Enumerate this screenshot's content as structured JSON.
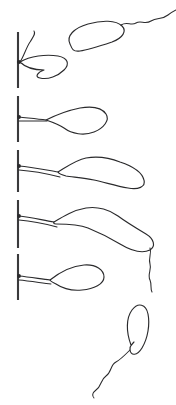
{
  "figure": {
    "title": "Bacterial attachment sequence",
    "width": 176,
    "height": 405,
    "background_color": "#ffffff",
    "ink_color": "#2a2a2c",
    "substratum_color": "#3a3a3c",
    "style": "line drawing, ink on white, no labels or text"
  },
  "substratum": {
    "name": "surface-line",
    "orientation": "vertical",
    "style": "dashed",
    "x": 18,
    "segments": [
      {
        "id": "seg-1",
        "y_top": 32,
        "y_bottom": 88
      },
      {
        "id": "seg-2",
        "y_top": 96,
        "y_bottom": 142
      },
      {
        "id": "seg-3",
        "y_top": 150,
        "y_bottom": 192
      },
      {
        "id": "seg-4",
        "y_top": 200,
        "y_bottom": 248
      },
      {
        "id": "seg-5",
        "y_top": 254,
        "y_bottom": 300
      }
    ]
  },
  "cells": [
    {
      "id": "cell-free-top",
      "label": "free-swimming cell, upper right",
      "state": "unattached",
      "shape": "curved rod (vibrio)",
      "flagellum": "single polar, wavy, trailing to upper right",
      "body_path": "M 70 44 C 66 36, 74 28, 88 24 C 102 20, 116 20, 122 26 C 127 31, 123 38, 112 42 C 100 46, 88 50, 80 51 C 73 52, 72 49, 70 44 Z",
      "flagellum_path": "M 121 25 C 127 21, 131 26, 136 23 C 141 20, 145 25, 151 21 C 157 17, 162 20, 168 15 C 172 12, 174 11, 176 10"
    },
    {
      "id": "cell-attached-1",
      "label": "attached cell, stage 1 (short, flagellum bent upward)",
      "state": "attached",
      "stage": 1,
      "attachment_y": 62,
      "shape": "short curved rod",
      "flagellum": "single polar, curls up along surface",
      "body_path": "M 20 62 C 30 56, 46 54, 58 56 C 68 58, 70 64, 64 70 C 58 76, 48 80, 40 78 C 34 77, 38 72, 44 70 C 36 70, 26 68, 20 62 Z",
      "flagellum_path": "M 20 62 C 24 56, 26 48, 30 42 C 33 37, 36 34, 34 31"
    },
    {
      "id": "cell-attached-2",
      "label": "attached cell, stage 2 (elongating, flagellum stretched along surface)",
      "state": "attached",
      "stage": 2,
      "attachment_y": 118,
      "shape": "elongated curved rod",
      "flagellum": "single polar, taut, anchored to surface",
      "body_path": "M 46 120 C 58 114, 70 110, 80 108 C 92 106, 102 108, 106 114 C 110 120, 104 128, 94 132 C 84 136, 72 134, 64 128 C 58 124, 52 122, 46 120 Z",
      "flagellum_path": "M 19 117 C 28 118, 38 119, 46 120"
    },
    {
      "id": "cell-attached-3",
      "label": "attached cell, stage 3 (longer body, lumpy outline)",
      "state": "attached",
      "stage": 3,
      "attachment_y": 168,
      "shape": "long undulating rod",
      "flagellum": "single polar, taut, anchored to surface",
      "body_path": "M 58 172 C 68 166, 76 160, 86 158 C 98 156, 110 158, 120 162 C 132 166, 142 172, 144 180 C 146 187, 138 190, 128 188 C 116 186, 104 182, 94 180 C 84 178, 72 177, 66 176 C 62 175, 59 174, 58 172 Z",
      "flagellum_path": "M 19 166 C 32 167, 46 170, 58 172"
    },
    {
      "id": "cell-attached-4",
      "label": "attached cell, stage 4 (longest body, free flagellum trailing away)",
      "state": "attached",
      "stage": 4,
      "attachment_y": 218,
      "shape": "very long undulating rod",
      "flagellum": "polar flagellum anchored at surface plus free wavy flagellum trailing to lower right",
      "body_path": "M 54 222 C 64 216, 74 210, 86 208 C 98 206, 110 210, 118 216 C 126 222, 136 228, 146 234 C 154 239, 156 246, 150 250 C 142 254, 130 250, 120 244 C 110 238, 98 232, 88 228 C 78 224, 64 224, 56 224 C 54 224, 53 223, 54 222 Z",
      "flagellum_path": "M 19 216 C 30 217, 42 220, 54 222",
      "trailing_flagellum_path": "M 150 248 C 152 254, 148 258, 150 264 C 152 270, 147 274, 150 280 C 152 285, 150 288, 152 292"
    },
    {
      "id": "cell-attached-5",
      "label": "attached cell, stage 5 (medium body, division-ready)",
      "state": "attached",
      "stage": 5,
      "attachment_y": 276,
      "shape": "curved rod",
      "flagellum": "single polar, taut, anchored to surface",
      "body_path": "M 50 280 C 60 272, 72 266, 84 265 C 96 264, 104 270, 104 277 C 104 284, 94 289, 82 290 C 72 291, 62 288, 56 284 C 52 282, 50 281, 50 280 Z",
      "flagellum_path": "M 19 276 C 30 277, 41 279, 50 280"
    },
    {
      "id": "cell-free-bottom",
      "label": "free-swimming cell, lower right",
      "state": "unattached",
      "shape": "comma-shaped (vibrio)",
      "flagellum": "single polar, long and wavy, trailing to lower left",
      "body_path": "M 131 345 C 126 332, 126 318, 132 310 C 138 302, 146 304, 148 314 C 150 324, 148 338, 142 348 C 137 356, 131 356, 130 350 C 129 346, 131 346, 134 342 C 132 344, 131 346, 131 345 Z",
      "flagellum_path": "M 130 350 C 124 356, 120 360, 116 362 C 110 365, 112 372, 106 376 C 100 380, 102 386, 96 390 C 92 393, 92 396, 94 398"
    }
  ],
  "anchors": [
    {
      "id": "anchor-1",
      "x": 19,
      "y": 62
    },
    {
      "id": "anchor-2",
      "x": 19,
      "y": 117
    },
    {
      "id": "anchor-3",
      "x": 19,
      "y": 166
    },
    {
      "id": "anchor-4",
      "x": 19,
      "y": 216
    },
    {
      "id": "anchor-5",
      "x": 19,
      "y": 276
    }
  ]
}
